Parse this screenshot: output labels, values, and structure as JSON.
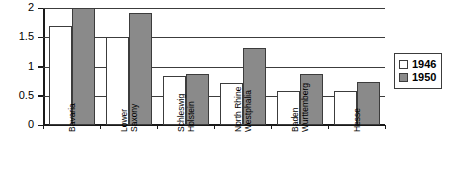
{
  "chart_data": {
    "type": "bar",
    "title": "",
    "subtitle": "",
    "xlabel": "",
    "ylabel": "",
    "ylim": [
      0,
      2
    ],
    "yticks": [
      "0",
      "0.5",
      "1",
      "1.5",
      "2"
    ],
    "ytick_values": [
      0,
      0.5,
      1,
      1.5,
      2
    ],
    "grid": true,
    "legend_position": "right",
    "categories": [
      "Bavaria",
      "Lower Saxony",
      "Schleswig Holstein",
      "North Rhine Westphalia",
      "Baden Wurttemberg",
      "Hesse"
    ],
    "category_lines": [
      [
        "Bavaria"
      ],
      [
        "Lower",
        "Saxony"
      ],
      [
        "Schleswig",
        "Holstein"
      ],
      [
        "North Rhine",
        "Westphalia"
      ],
      [
        "Baden",
        "Wurttemberg"
      ],
      [
        "Hesse"
      ]
    ],
    "series": [
      {
        "name": "1946",
        "color": "#ffffff",
        "values": [
          1.7,
          1.5,
          0.84,
          0.72,
          0.58,
          0.58
        ]
      },
      {
        "name": "1950",
        "color": "#8a8a8a",
        "values": [
          2.0,
          1.92,
          0.87,
          1.31,
          0.87,
          0.74
        ]
      }
    ]
  },
  "legend": {
    "items": [
      {
        "label": "1946",
        "color": "#ffffff"
      },
      {
        "label": "1950",
        "color": "#8a8a8a"
      }
    ]
  },
  "colors": {
    "series_1946": "#ffffff",
    "series_1950": "#8a8a8a",
    "axis": "#1a1a1a",
    "gridline": "#3c3c3c",
    "background": "#ffffff"
  }
}
